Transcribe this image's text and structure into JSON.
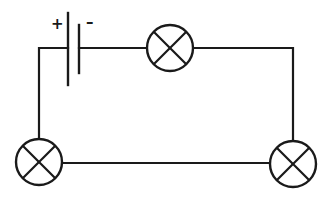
{
  "diagram": {
    "type": "series circuit",
    "stroke_color": "#1a1a1a",
    "background_color": "#ffffff",
    "battery": {
      "positive_label": "+",
      "negative_label": "–"
    },
    "bulbs": [
      {
        "id": "top",
        "position": "top-center"
      },
      {
        "id": "bottom-left",
        "position": "bottom-left"
      },
      {
        "id": "bottom-right",
        "position": "bottom-right"
      }
    ]
  }
}
